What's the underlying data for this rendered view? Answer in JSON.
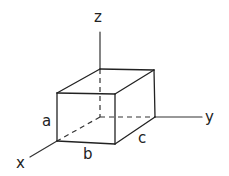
{
  "diagram": {
    "title": "",
    "axes": {
      "x_label": "x",
      "y_label": "y",
      "z_label": "z"
    },
    "dimensions": {
      "height_label": "a",
      "width_label": "b",
      "depth_label": "c"
    },
    "shape": "rectangular box",
    "hidden_edges": 3,
    "line_color": "#222222",
    "background": "#ffffff"
  }
}
